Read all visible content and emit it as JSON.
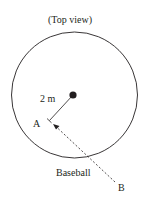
{
  "diagram": {
    "title": "(Top view)",
    "radius_label": "2 m",
    "point_a_label": "A",
    "point_b_label": "B",
    "object_label": "Baseball",
    "colors": {
      "stroke": "#231f20",
      "background": "#ffffff"
    },
    "shapes": {
      "circle": {
        "cx": 74.5,
        "cy": 95,
        "r": 63
      },
      "pivot": {
        "cx": 73,
        "cy": 95,
        "r": 3.6
      },
      "radius_line": {
        "x1": 73,
        "y1": 95,
        "x2": 49,
        "y2": 121
      },
      "trajectory": {
        "from": "B",
        "to": "A",
        "style": "dashed-arrow"
      }
    }
  }
}
